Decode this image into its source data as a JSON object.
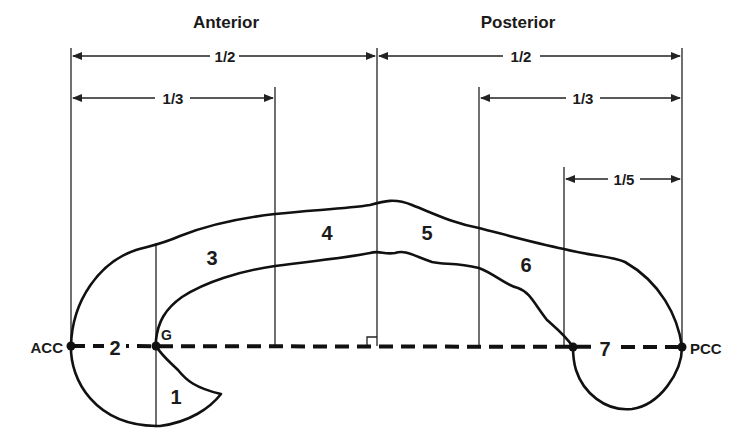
{
  "diagram": {
    "title_left": "Anterior",
    "title_right": "Posterior",
    "measurements": {
      "anterior_half": "1/2",
      "anterior_third": "1/3",
      "posterior_half": "1/2",
      "posterior_third": "1/3",
      "posterior_fifth": "1/5"
    },
    "landmarks": {
      "acc": "ACC",
      "pcc": "PCC",
      "genu": "G"
    },
    "regions": [
      "1",
      "2",
      "3",
      "4",
      "5",
      "6",
      "7"
    ]
  }
}
